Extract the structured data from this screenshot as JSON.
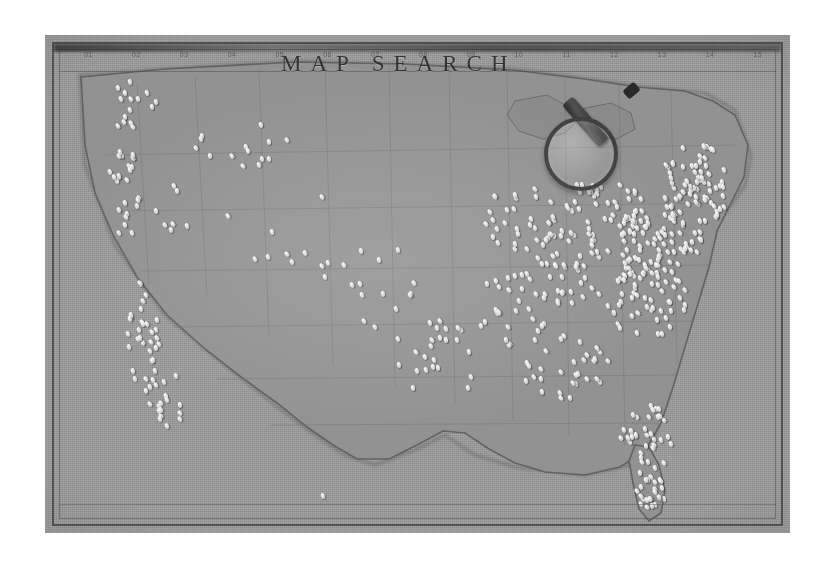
{
  "photo": {
    "title": "MAP SEARCH",
    "subject": "united-states-wall-map-with-pins",
    "medium": "black-and-white-photograph",
    "background_color": "#9a9a9a",
    "ink_color": "#2e2e2e",
    "pin_color": "#ffffff"
  },
  "ruler": {
    "ticks": [
      "01",
      "02",
      "03",
      "04",
      "05",
      "06",
      "07",
      "08",
      "09",
      "10",
      "11",
      "12",
      "13",
      "14",
      "15"
    ]
  },
  "magnifier": {
    "label": "magnifying-glass",
    "lens_color": "#3b3b3b",
    "handle_color": "#2a2a2a"
  },
  "map": {
    "regions": [
      {
        "name": "contiguous-united-states",
        "pin_density": "high-east-low-west"
      },
      {
        "name": "alaska",
        "pin_density": "none"
      },
      {
        "name": "hawaii",
        "pin_density": "single"
      }
    ],
    "pin_clusters": [
      {
        "name": "northeast-corridor",
        "density": "very-high"
      },
      {
        "name": "mid-atlantic",
        "density": "very-high"
      },
      {
        "name": "great-lakes",
        "density": "high"
      },
      {
        "name": "southeast-florida-coast",
        "density": "high"
      },
      {
        "name": "california-coast",
        "density": "high"
      },
      {
        "name": "midwest",
        "density": "medium"
      },
      {
        "name": "texas-south-central",
        "density": "medium"
      },
      {
        "name": "mountain-west",
        "density": "low"
      },
      {
        "name": "pacific-northwest",
        "density": "low"
      }
    ],
    "pin_total_estimate": 620
  }
}
